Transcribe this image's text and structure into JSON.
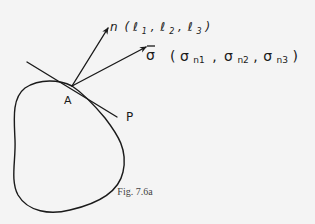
{
  "figure": {
    "caption": "Fig. 7.6a",
    "point_label": "A",
    "plane_label": "P",
    "normal": {
      "symbol": "n",
      "components_open": "(",
      "l1": "ℓ",
      "l1_sub": "1",
      "l2": "ℓ",
      "l2_sub": "2",
      "l3": "ℓ",
      "l3_sub": "3",
      "components_close": ")",
      "sep": ","
    },
    "stress": {
      "symbol": "σ",
      "bar": "‾",
      "open": "(",
      "c1": "σ",
      "c1_sub": "n1",
      "c2": "σ",
      "c2_sub": "n2",
      "c3": "σ",
      "c3_sub": "n3",
      "close": ")",
      "sep": ","
    },
    "colors": {
      "ink": "#1a1a1a",
      "background": "#f4f4f4",
      "caption": "#444444"
    }
  }
}
